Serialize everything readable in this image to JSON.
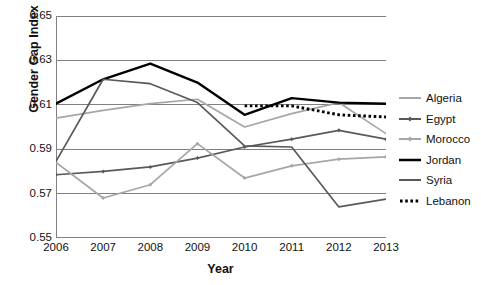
{
  "chart_data": {
    "type": "line",
    "title": "",
    "xlabel": "Year",
    "ylabel": "Gender Gap Index",
    "x": [
      2006,
      2007,
      2008,
      2009,
      2010,
      2011,
      2012,
      2013
    ],
    "xticklabels": [
      "2006",
      "2007",
      "2008",
      "2009",
      "2010",
      "2011",
      "2012",
      "2013"
    ],
    "yticklabels": [
      "0.65",
      "0.63",
      "0.61",
      "0.59",
      "0.57",
      "0.55"
    ],
    "ytickvalues": [
      0.65,
      0.63,
      0.61,
      0.59,
      0.57,
      0.55
    ],
    "ylim": [
      0.55,
      0.65
    ],
    "xlim": [
      2006,
      2013
    ],
    "grid": "horizontal",
    "legend_position": "right",
    "series": [
      {
        "name": "Algeria",
        "color": "#a6a6a6",
        "style": "solid",
        "marker": "none",
        "values": [
          0.604,
          0.6075,
          0.6105,
          0.6125,
          0.6,
          0.606,
          0.611,
          0.597
        ]
      },
      {
        "name": "Egypt",
        "color": "#595959",
        "style": "solid",
        "marker": "diamond",
        "values": [
          0.5785,
          0.58,
          0.582,
          0.586,
          0.591,
          0.5945,
          0.5985,
          0.5945
        ]
      },
      {
        "name": "Morocco",
        "color": "#a6a6a6",
        "style": "solid",
        "marker": "diamond",
        "values": [
          0.584,
          0.568,
          0.574,
          0.5925,
          0.577,
          0.5825,
          0.5855,
          0.5865
        ]
      },
      {
        "name": "Jordan",
        "color": "#000000",
        "style": "solid",
        "marker": "none",
        "values": [
          0.6105,
          0.6215,
          0.6285,
          0.62,
          0.6055,
          0.613,
          0.611,
          0.6105
        ]
      },
      {
        "name": "Syria",
        "color": "#595959",
        "style": "solid",
        "marker": "none",
        "values": [
          0.5845,
          0.6215,
          0.6195,
          0.611,
          0.5915,
          0.591,
          0.564,
          0.5675
        ]
      },
      {
        "name": "Lebanon",
        "color": "#000000",
        "style": "dotted",
        "marker": "none",
        "values": [
          null,
          null,
          null,
          null,
          0.6095,
          0.6095,
          0.6055,
          0.6045
        ]
      }
    ]
  },
  "legend": {
    "items": [
      {
        "label": "Algeria"
      },
      {
        "label": "Egypt"
      },
      {
        "label": "Morocco"
      },
      {
        "label": "Jordan"
      },
      {
        "label": "Syria"
      },
      {
        "label": "Lebanon"
      }
    ]
  }
}
